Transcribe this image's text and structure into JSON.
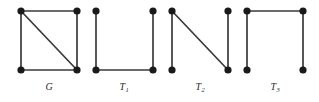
{
  "figure": {
    "width": 319,
    "height": 102,
    "background_color": "#ffffff",
    "edge_color": "#3a3a3a",
    "vertex_color": "#1a1a1a",
    "vertex_radius": 3.6,
    "label_color": "#2b2b2b"
  },
  "graphs": [
    {
      "id": "G",
      "label_text": "G",
      "label_sub": "",
      "label_x": 49,
      "label_y": 82,
      "vertices": [
        {
          "name": "top-left",
          "x": 21,
          "y": 11
        },
        {
          "name": "top-right",
          "x": 77,
          "y": 11
        },
        {
          "name": "bottom-left",
          "x": 21,
          "y": 70
        },
        {
          "name": "bottom-right",
          "x": 77,
          "y": 70
        }
      ],
      "edges": [
        {
          "name": "top",
          "x1": 21,
          "y1": 11,
          "x2": 77,
          "y2": 11
        },
        {
          "name": "left",
          "x1": 21,
          "y1": 11,
          "x2": 21,
          "y2": 70
        },
        {
          "name": "right",
          "x1": 77,
          "y1": 11,
          "x2": 77,
          "y2": 70
        },
        {
          "name": "bottom",
          "x1": 21,
          "y1": 70,
          "x2": 77,
          "y2": 70
        },
        {
          "name": "diagonal",
          "x1": 21,
          "y1": 11,
          "x2": 77,
          "y2": 70
        }
      ]
    },
    {
      "id": "T1",
      "label_text": "T",
      "label_sub": "1",
      "label_x": 124,
      "label_y": 82,
      "vertices": [
        {
          "name": "top-left",
          "x": 96,
          "y": 11
        },
        {
          "name": "top-right",
          "x": 153,
          "y": 11
        },
        {
          "name": "bottom-left",
          "x": 96,
          "y": 70
        },
        {
          "name": "bottom-right",
          "x": 153,
          "y": 70
        }
      ],
      "edges": [
        {
          "name": "left",
          "x1": 96,
          "y1": 11,
          "x2": 96,
          "y2": 70
        },
        {
          "name": "bottom",
          "x1": 96,
          "y1": 70,
          "x2": 153,
          "y2": 70
        },
        {
          "name": "right",
          "x1": 153,
          "y1": 11,
          "x2": 153,
          "y2": 70
        }
      ]
    },
    {
      "id": "T2",
      "label_text": "T",
      "label_sub": "2",
      "label_x": 200,
      "label_y": 82,
      "vertices": [
        {
          "name": "top-left",
          "x": 172,
          "y": 11
        },
        {
          "name": "top-right",
          "x": 228,
          "y": 11
        },
        {
          "name": "bottom-left",
          "x": 172,
          "y": 70
        },
        {
          "name": "bottom-right",
          "x": 228,
          "y": 70
        }
      ],
      "edges": [
        {
          "name": "left",
          "x1": 172,
          "y1": 11,
          "x2": 172,
          "y2": 70
        },
        {
          "name": "diagonal",
          "x1": 172,
          "y1": 11,
          "x2": 228,
          "y2": 70
        },
        {
          "name": "right",
          "x1": 228,
          "y1": 11,
          "x2": 228,
          "y2": 70
        }
      ]
    },
    {
      "id": "T3",
      "label_text": "T",
      "label_sub": "3",
      "label_x": 275,
      "label_y": 82,
      "vertices": [
        {
          "name": "top-left",
          "x": 247,
          "y": 11
        },
        {
          "name": "top-right",
          "x": 303,
          "y": 11
        },
        {
          "name": "bottom-left",
          "x": 247,
          "y": 70
        },
        {
          "name": "bottom-right",
          "x": 303,
          "y": 70
        }
      ],
      "edges": [
        {
          "name": "left",
          "x1": 247,
          "y1": 11,
          "x2": 247,
          "y2": 70
        },
        {
          "name": "top",
          "x1": 247,
          "y1": 11,
          "x2": 303,
          "y2": 11
        },
        {
          "name": "right",
          "x1": 303,
          "y1": 11,
          "x2": 303,
          "y2": 70
        }
      ]
    }
  ]
}
